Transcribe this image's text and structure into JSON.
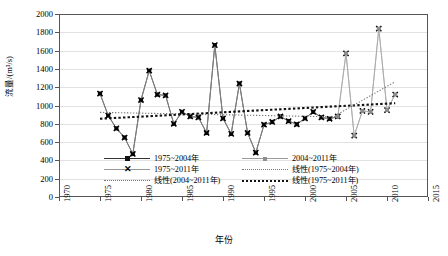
{
  "chart_data": {
    "type": "line",
    "title": "",
    "xlabel": "年份",
    "ylabel": "流量/(m³/s)",
    "xlim": [
      1970,
      2015
    ],
    "ylim": [
      0,
      2000
    ],
    "ytick_step": 200,
    "xtick_step": 5,
    "grid": true,
    "legend_position": "inside-bottom",
    "xticks": [
      "1970",
      "1975",
      "1980",
      "1985",
      "1990",
      "1995",
      "2000",
      "2005",
      "2010",
      "2015"
    ],
    "yticks": [
      "0",
      "200",
      "400",
      "600",
      "800",
      "1000",
      "1200",
      "1400",
      "1600",
      "1800",
      "2000"
    ],
    "series": [
      {
        "name": "1975~2004年",
        "marker": "filled-square",
        "color": "#111111",
        "x": [
          1975,
          1976,
          1977,
          1978,
          1979,
          1980,
          1981,
          1982,
          1983,
          1984,
          1985,
          1986,
          1987,
          1988,
          1989,
          1990,
          1991,
          1992,
          1993,
          1994,
          1995,
          1996,
          1997,
          1998,
          1999,
          2000,
          2001,
          2002,
          2003,
          2004
        ],
        "values": [
          1130,
          890,
          750,
          650,
          470,
          1060,
          1380,
          1120,
          1110,
          800,
          930,
          880,
          870,
          700,
          1660,
          860,
          690,
          1240,
          700,
          485,
          790,
          820,
          880,
          830,
          795,
          860,
          930,
          870,
          855,
          880
        ]
      },
      {
        "name": "1975~2011年",
        "marker": "x-cross",
        "color": "#111111",
        "x": [
          1975,
          1976,
          1977,
          1978,
          1979,
          1980,
          1981,
          1982,
          1983,
          1984,
          1985,
          1986,
          1987,
          1988,
          1989,
          1990,
          1991,
          1992,
          1993,
          1994,
          1995,
          1996,
          1997,
          1998,
          1999,
          2000,
          2001,
          2002,
          2003,
          2004,
          2005,
          2006,
          2007,
          2008,
          2009,
          2010,
          2011
        ],
        "values": [
          1130,
          890,
          750,
          650,
          470,
          1060,
          1380,
          1120,
          1110,
          800,
          930,
          880,
          870,
          700,
          1660,
          860,
          690,
          1240,
          700,
          485,
          790,
          820,
          880,
          830,
          795,
          860,
          930,
          870,
          855,
          880,
          1570,
          670,
          940,
          930,
          1840,
          950,
          1120
        ]
      },
      {
        "name": "2004~2011年",
        "marker": "filled-square-gray",
        "color": "#8d8d8d",
        "x": [
          2004,
          2005,
          2006,
          2007,
          2008,
          2009,
          2010,
          2011
        ],
        "values": [
          880,
          1570,
          670,
          940,
          930,
          1840,
          950,
          1120
        ]
      },
      {
        "name": "线性(1975~2004年)",
        "type": "trend",
        "style": "dotted-fine",
        "color": "#777777",
        "x": [
          1975,
          2004
        ],
        "values": [
          925,
          875
        ]
      },
      {
        "name": "线性(1975~2011年)",
        "type": "trend",
        "style": "dotted-bold",
        "color": "#111111",
        "x": [
          1975,
          2011
        ],
        "values": [
          855,
          1025
        ]
      },
      {
        "name": "线性(2004~2011年)",
        "type": "trend",
        "style": "dotted-fine",
        "color": "#777777",
        "x": [
          2004,
          2011
        ],
        "values": [
          905,
          1260
        ]
      }
    ]
  },
  "legend": {
    "left_column": [
      {
        "label": "1975~2004年",
        "key": "line-square"
      },
      {
        "label": "1975~2011年",
        "key": "line-x"
      },
      {
        "label": "线性(2004~2011年)",
        "key": "dotted-fine"
      }
    ],
    "right_column": [
      {
        "label": "2004~2011年",
        "key": "line-square-gray"
      },
      {
        "label": "线性(1975~2004年)",
        "key": "dotted-fine"
      },
      {
        "label": "线性(1975~2011年)",
        "key": "dotted-bold"
      }
    ]
  }
}
